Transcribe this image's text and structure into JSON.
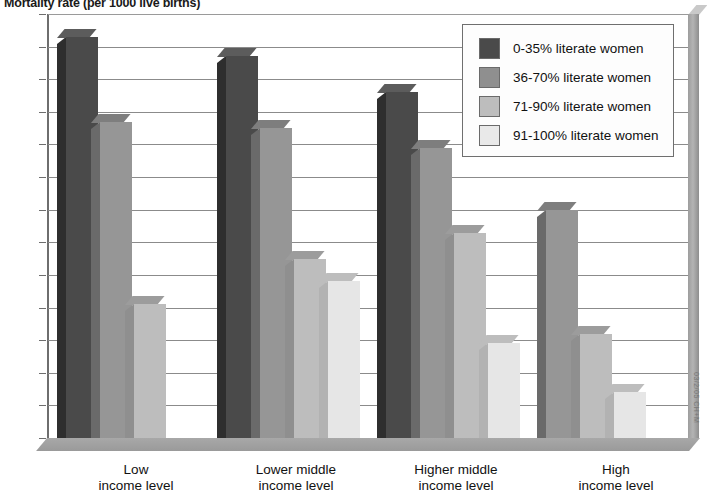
{
  "chart_data": {
    "type": "bar",
    "title": "Mortality rate (per 1000 live births)",
    "xlabel": "",
    "ylabel": "",
    "ylim": [
      0,
      130
    ],
    "ytick_step": 10,
    "grid": true,
    "legend_position": "top-right-inset",
    "categories": [
      "Low\nincome level",
      "Lower middle\nincome level",
      "Higher middle\nincome level",
      "High\nincome level"
    ],
    "category_lines": [
      [
        "Low",
        "income level"
      ],
      [
        "Lower middle",
        "income level"
      ],
      [
        "Higher middle",
        "income level"
      ],
      [
        "High",
        "income level"
      ]
    ],
    "series": [
      {
        "name": "0-35% literate women",
        "values": [
          123,
          117,
          106,
          null
        ]
      },
      {
        "name": "36-70% literate women",
        "values": [
          97,
          95,
          89,
          70
        ]
      },
      {
        "name": "71-90% literate women",
        "values": [
          41,
          55,
          63,
          32
        ]
      },
      {
        "name": "91-100% literate women",
        "values": [
          null,
          48,
          29,
          14
        ]
      }
    ],
    "ytick_labels": [
      "0",
      "10",
      "20",
      "30",
      "40",
      "50",
      "60",
      "70",
      "80",
      "90",
      "100",
      "110",
      "120",
      "130"
    ],
    "colors": {
      "series_0": "#4a4a4a",
      "series_1": "#969696",
      "series_2": "#bdbdbd",
      "series_3": "#e6e6e6",
      "gridline": "#8b8b8b",
      "background": "#ffffff"
    }
  },
  "legend": {
    "items": [
      {
        "label": "0-35% literate women"
      },
      {
        "label": "36-70% literate women"
      },
      {
        "label": "71-90% literate women"
      },
      {
        "label": "91-100% literate women"
      }
    ]
  },
  "credit": "03/2/05 CH+M"
}
